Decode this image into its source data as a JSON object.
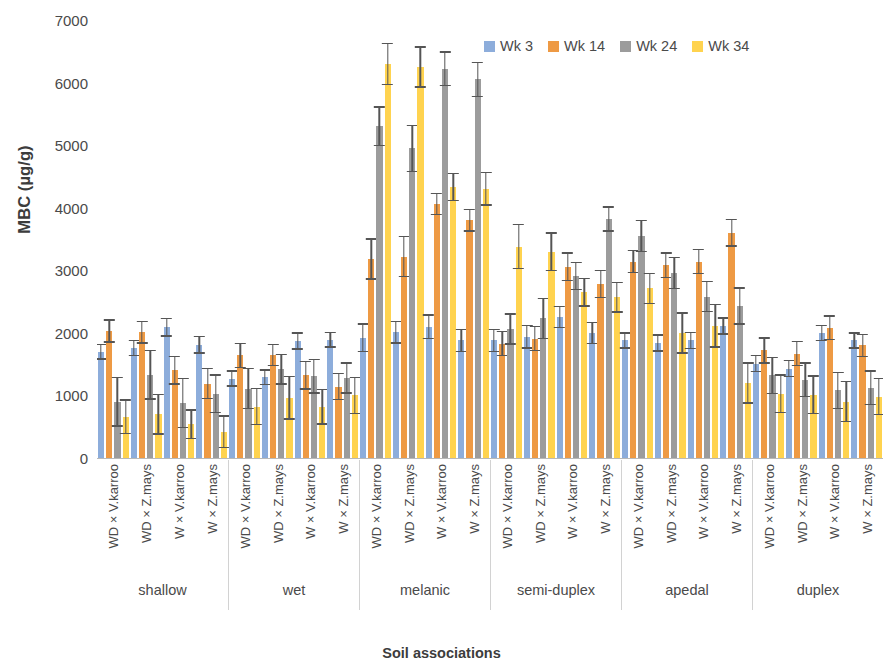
{
  "chart_data": {
    "type": "bar",
    "title": "",
    "xlabel": "Soil associations",
    "ylabel": "MBC (µg/g)",
    "ylim": [
      0,
      7000
    ],
    "ytick_labels": [
      "7000",
      "6000",
      "5000",
      "4000",
      "3000",
      "2000",
      "1000",
      "0"
    ],
    "ytick_values": [
      7000,
      6000,
      5000,
      4000,
      3000,
      2000,
      1000,
      0
    ],
    "grid": false,
    "legend_position": "top-right",
    "error_bars": true,
    "series_names": [
      "Wk 3",
      "Wk 14",
      "Wk 24",
      "Wk 34"
    ],
    "series_colors": [
      "#8DADDB",
      "#EE9A44",
      "#9C9C9C",
      "#FFD34F"
    ],
    "treatments": [
      "WD × V.karroo",
      "WD × Z.mays",
      "W × V.karroo",
      "W × Z.mays"
    ],
    "groups": [
      "shallow",
      "wet",
      "melanic",
      "semi-duplex",
      "apedal",
      "duplex"
    ],
    "clusters": [
      {
        "group": "shallow",
        "treatment": "WD × V.karroo",
        "values": [
          1700,
          2030,
          900,
          660
        ],
        "errors": [
          130,
          190,
          400,
          280
        ]
      },
      {
        "group": "shallow",
        "treatment": "WD × Z.mays",
        "values": [
          1760,
          2010,
          1330,
          700
        ],
        "errors": [
          130,
          180,
          400,
          330
        ]
      },
      {
        "group": "shallow",
        "treatment": "W × V.karroo",
        "values": [
          2090,
          1400,
          880,
          540
        ],
        "errors": [
          150,
          230,
          400,
          240
        ]
      },
      {
        "group": "shallow",
        "treatment": "W × Z.mays",
        "values": [
          1810,
          1190,
          1030,
          420
        ],
        "errors": [
          140,
          250,
          310,
          260
        ]
      },
      {
        "group": "wet",
        "treatment": "WD × V.karroo",
        "values": [
          1270,
          1640,
          1110,
          820
        ],
        "errors": [
          130,
          200,
          330,
          300
        ]
      },
      {
        "group": "wet",
        "treatment": "WD × Z.mays",
        "values": [
          1290,
          1650,
          1420,
          960
        ],
        "errors": [
          130,
          180,
          250,
          350
        ]
      },
      {
        "group": "wet",
        "treatment": "W × V.karroo",
        "values": [
          1870,
          1320,
          1310,
          820
        ],
        "errors": [
          140,
          230,
          280,
          290
        ]
      },
      {
        "group": "wet",
        "treatment": "W × Z.mays",
        "values": [
          1890,
          1140,
          1280,
          1000
        ],
        "errors": [
          130,
          220,
          250,
          300
        ]
      },
      {
        "group": "melanic",
        "treatment": "WD × V.karroo",
        "values": [
          1920,
          3180,
          5300,
          6300
        ],
        "errors": [
          230,
          330,
          320,
          340
        ]
      },
      {
        "group": "melanic",
        "treatment": "WD × Z.mays",
        "values": [
          2010,
          3220,
          4950,
          6250
        ],
        "errors": [
          180,
          330,
          380,
          330
        ]
      },
      {
        "group": "melanic",
        "treatment": "W × V.karroo",
        "values": [
          2100,
          4060,
          6220,
          4330
        ],
        "errors": [
          200,
          180,
          280,
          230
        ]
      },
      {
        "group": "melanic",
        "treatment": "W × Z.mays",
        "values": [
          1880,
          3800,
          6050,
          4300
        ],
        "errors": [
          190,
          180,
          280,
          270
        ]
      },
      {
        "group": "semi-duplex",
        "treatment": "WD × V.karroo",
        "values": [
          1880,
          1830,
          2060,
          3380
        ],
        "errors": [
          190,
          200,
          250,
          360
        ]
      },
      {
        "group": "semi-duplex",
        "treatment": "WD × Z.mays",
        "values": [
          1940,
          1910,
          2230,
          3300
        ],
        "errors": [
          190,
          200,
          330,
          310
        ]
      },
      {
        "group": "semi-duplex",
        "treatment": "W × V.karroo",
        "values": [
          2250,
          3060,
          2910,
          2650
        ],
        "errors": [
          180,
          230,
          230,
          230
        ]
      },
      {
        "group": "semi-duplex",
        "treatment": "W × Z.mays",
        "values": [
          2000,
          2780,
          3820,
          2570
        ],
        "errors": [
          180,
          230,
          200,
          250
        ]
      },
      {
        "group": "apedal",
        "treatment": "WD × V.karroo",
        "values": [
          1880,
          3140,
          3550,
          2710
        ],
        "errors": [
          130,
          190,
          260,
          250
        ]
      },
      {
        "group": "apedal",
        "treatment": "WD × Z.mays",
        "values": [
          1840,
          3080,
          2960,
          2000
        ],
        "errors": [
          140,
          210,
          260,
          330
        ]
      },
      {
        "group": "apedal",
        "treatment": "W × V.karroo",
        "values": [
          1880,
          3140,
          2580,
          2110
        ],
        "errors": [
          140,
          200,
          250,
          350
        ]
      },
      {
        "group": "apedal",
        "treatment": "W × Z.mays",
        "values": [
          2110,
          3600,
          2430,
          1200
        ],
        "errors": [
          140,
          220,
          300,
          330
        ]
      },
      {
        "group": "duplex",
        "treatment": "WD × V.karroo",
        "values": [
          1510,
          1720,
          1320,
          1030
        ],
        "errors": [
          140,
          210,
          300,
          310
        ]
      },
      {
        "group": "duplex",
        "treatment": "WD × Z.mays",
        "values": [
          1430,
          1670,
          1250,
          1010
        ],
        "errors": [
          140,
          200,
          280,
          310
        ]
      },
      {
        "group": "duplex",
        "treatment": "W × V.karroo",
        "values": [
          2000,
          2080,
          1080,
          900
        ],
        "errors": [
          130,
          200,
          300,
          330
        ]
      },
      {
        "group": "duplex",
        "treatment": "W × Z.mays",
        "values": [
          1880,
          1800,
          1120,
          980
        ],
        "errors": [
          130,
          190,
          280,
          300
        ]
      }
    ]
  },
  "legend": {
    "items": [
      {
        "label": "Wk 3",
        "color": "#8DADDB"
      },
      {
        "label": "Wk 14",
        "color": "#EE9A44"
      },
      {
        "label": "Wk 24",
        "color": "#9C9C9C"
      },
      {
        "label": "Wk 34",
        "color": "#FFD34F"
      }
    ]
  },
  "axes": {
    "y_title": "MBC (µg/g)",
    "x_title": "Soil associations"
  }
}
